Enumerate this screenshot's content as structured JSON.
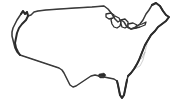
{
  "figure": {
    "projection_note": "Albers-like conic, lower 48 states",
    "background_color": "#ffffff",
    "state_border_color": "#a8a8a8",
    "national_outline_color": "#3a3a3a",
    "coast_emphasis_color": "#2b2b2b",
    "lake_outline_color": "#2e2e2e",
    "width_px": "174",
    "height_px": "108",
    "labels_shown": "none",
    "legend_shown": "none"
  },
  "regions": {
    "pacific_coast_label": "Pacific coastline",
    "atlantic_coast_label": "Atlantic coastline",
    "gulf_coast_label": "Gulf of Mexico coastline",
    "northern_border_label": "Canada border",
    "southern_border_label": "Mexico border",
    "great_lakes_label": "Great Lakes",
    "florida_label": "Florida peninsula",
    "texas_label": "Texas",
    "new_england_label": "New England",
    "chesapeake_label": "Chesapeake Bay",
    "mississippi_delta_label": "Mississippi Delta",
    "puget_sound_label": "Puget Sound"
  },
  "map_paths": {
    "outer_boundary": "M 21 14 L 23 11 L 25 14 L 27 12 L 28 16 L 31 15 L 34 12 L 38 11 L 46 10 L 60 9 L 75 8 L 92 7 L 104 6 L 108 9 L 112 14 L 115 19 L 118 22 L 121 20 L 124 22 L 127 27 L 131 29 L 136 27 L 140 24 L 143 20 L 146 14 L 149 10 L 152 5 L 156 3 L 160 6 L 163 11 L 166 15 L 169 17 L 166 21 L 162 24 L 158 27 L 155 31 L 151 35 L 148 40 L 145 45 L 143 50 L 141 55 L 139 60 L 137 64 L 134 69 L 131 73 L 128 76 L 127 80 L 126 85 L 125 90 L 124 95 L 122 98 L 120 95 L 119 90 L 118 85 L 117 81 L 114 79 L 109 78 L 104 77 L 99 76 L 95 75 L 91 76 L 88 78 L 85 80 L 82 82 L 79 84 L 76 86 L 73 87 L 70 85 L 68 81 L 66 77 L 64 73 L 62 70 L 59 68 L 56 67 L 53 66 L 50 65 L 47 64 L 44 63 L 41 62 L 38 61 L 35 60 L 32 59 L 29 58 L 26 57 L 23 56 L 20 55 L 17 52 L 15 48 L 14 44 L 13 40 L 12 36 L 12 32 L 13 28 L 15 24 L 17 20 L 19 17 Z",
    "state_lines": [
      "M 21 14 L 23 11 L 25 14 L 27 12 L 28 16 L 31 15 L 34 12 L 38 11 L 40 25 L 36 26 L 32 27 L 28 28 L 24 29 L 21 30 L 19 26 L 18 22 L 19 17 Z",
      "M 19 30 L 24 29 L 28 28 L 32 27 L 36 26 L 40 25 L 41 36 L 36 37 L 31 38 L 27 39 L 23 40 L 18 41 L 17 36 L 18 33 Z",
      "M 18 41 L 23 40 L 27 39 L 31 38 L 36 37 L 41 36 L 42 44 L 38 45 L 34 46 L 30 47 L 26 48 L 22 49 L 20 46 Z",
      "M 38 11 L 46 10 L 47 20 L 48 28 L 44 29 L 40 25 Z",
      "M 40 25 L 44 29 L 48 28 L 49 38 L 45 39 L 41 36 Z",
      "M 41 36 L 45 39 L 49 38 L 50 48 L 46 49 L 42 44 Z",
      "M 42 44 L 46 49 L 50 48 L 51 58 L 47 60 L 43 56 Z",
      "M 46 10 L 60 9 L 61 20 L 62 28 L 55 29 L 47 20 Z",
      "M 47 20 L 55 29 L 62 28 L 63 38 L 56 39 L 49 38 L 48 28 Z",
      "M 49 38 L 56 39 L 63 38 L 64 48 L 57 49 L 50 48 Z",
      "M 50 48 L 57 49 L 64 48 L 65 58 L 58 60 L 51 58 Z",
      "M 60 9 L 75 8 L 76 20 L 77 28 L 69 29 L 61 20 Z",
      "M 61 20 L 69 29 L 77 28 L 78 38 L 70 39 L 62 28 Z",
      "M 62 28 L 70 39 L 78 38 L 79 48 L 71 49 L 63 38 Z",
      "M 63 38 L 71 49 L 79 48 L 80 58 L 72 60 L 64 48 Z",
      "M 75 8 L 92 7 L 93 18 L 94 26 L 84 27 L 76 20 Z",
      "M 76 20 L 84 27 L 94 26 L 95 36 L 86 37 L 77 28 Z",
      "M 77 28 L 86 37 L 95 36 L 96 46 L 87 47 L 78 38 Z",
      "M 78 38 L 87 47 L 96 46 L 97 56 L 88 58 L 79 48 Z",
      "M 92 7 L 104 6 L 105 17 L 106 25 L 98 26 L 93 18 Z",
      "M 93 18 L 98 26 L 106 25 L 107 34 L 99 35 L 94 26 Z",
      "M 94 26 L 99 35 L 107 34 L 108 43 L 100 44 L 95 36 Z",
      "M 95 36 L 100 44 L 108 43 L 109 52 L 101 54 L 96 46 Z",
      "M 104 6 L 108 9 L 112 14 L 115 19 L 112 25 L 108 26 L 105 17 Z",
      "M 105 17 L 108 26 L 112 25 L 115 19 L 118 22 L 121 20 L 122 28 L 116 31 L 110 33 L 107 34 L 106 25 Z",
      "M 107 34 L 110 33 L 116 31 L 122 28 L 123 36 L 117 38 L 111 40 L 108 43 Z",
      "M 108 43 L 111 40 L 117 38 L 123 36 L 124 45 L 118 47 L 112 49 L 109 52 Z",
      "M 121 20 L 124 22 L 127 27 L 131 29 L 132 36 L 127 37 L 122 28 Z",
      "M 122 28 L 127 37 L 132 36 L 133 44 L 128 45 L 123 36 Z",
      "M 123 36 L 128 45 L 133 44 L 134 53 L 129 54 L 124 45 Z",
      "M 131 29 L 136 27 L 140 24 L 143 20 L 144 28 L 138 31 L 132 36 Z",
      "M 132 36 L 138 31 L 144 28 L 146 36 L 139 39 L 133 44 Z",
      "M 133 44 L 139 39 L 146 36 L 147 44 L 141 48 L 134 53 Z",
      "M 143 20 L 146 14 L 149 10 L 152 5 L 156 3 L 158 10 L 152 14 L 147 18 L 144 28 Z",
      "M 156 3 L 160 6 L 163 11 L 166 15 L 169 17 L 164 20 L 159 22 L 158 10 Z",
      "M 134 53 L 141 48 L 147 44 L 145 52 L 142 58 L 136 62 Z",
      "M 136 62 L 142 58 L 145 52 L 143 60 L 140 66 L 134 69 Z",
      "M 109 52 L 112 49 L 118 47 L 124 45 L 125 54 L 119 57 L 113 59 L 110 61 Z",
      "M 110 61 L 113 59 L 119 57 L 125 54 L 126 63 L 120 66 L 114 68 L 111 70 Z",
      "M 97 56 L 101 54 L 109 52 L 110 61 L 104 63 L 98 65 Z",
      "M 98 65 L 104 63 L 110 61 L 111 70 L 105 72 L 99 74 Z",
      "M 80 58 L 88 58 L 97 56 L 98 65 L 90 67 L 82 68 Z",
      "M 82 68 L 90 67 L 98 65 L 99 74 L 95 75 L 91 76 L 88 78 L 85 80 Z",
      "M 51 58 L 58 60 L 65 58 L 67 66 L 64 73 L 62 70 L 59 68 L 56 67 L 53 66 Z",
      "M 65 58 L 72 60 L 80 58 L 82 68 L 85 80 L 82 82 L 79 84 L 76 86 L 73 87 L 70 85 L 68 81 L 66 77 L 64 73 L 67 66 Z",
      "M 111 70 L 114 68 L 120 66 L 126 63 L 127 72 L 121 75 L 115 77 L 114 79 Z",
      "M 114 79 L 117 81 L 118 85 L 119 90 L 120 95 L 122 98 L 124 95 L 125 90 L 126 85 L 127 80 L 128 76 L 127 72 L 121 75 L 115 77 Z"
    ],
    "great_lakes": [
      "M 112 17 L 115 16 L 119 18 L 121 22 L 120 26 L 117 28 L 114 27 L 112 24 L 111 20 Z",
      "M 121 20 L 125 19 L 128 22 L 128 26 L 125 28 L 122 27 L 121 24 Z",
      "M 106 14 L 111 13 L 114 15 L 113 18 L 109 19 L 106 17 Z",
      "M 128 24 L 133 23 L 137 25 L 136 28 L 131 29 L 128 27 Z",
      "M 136 26 L 142 24 L 146 22 L 145 25 L 140 27 L 136 28 Z"
    ],
    "heavy_coasts": [
      "M 21 14 L 23 11 L 25 14 L 27 12 L 28 16 L 26 20 L 22 24 L 19 28 L 17 33 L 16 38 L 15 43 L 16 48 L 18 52 L 20 55",
      "M 152 5 L 156 3 L 160 6 L 163 11 L 166 15 L 169 17 L 166 21 L 162 24 L 158 27 L 155 31 L 151 35 L 148 40 L 145 45 L 143 50 L 141 55 L 139 60 L 137 64 L 134 69 L 131 73 L 128 76",
      "M 127 80 L 126 85 L 125 90 L 124 95 L 122 98 L 120 95 L 119 90 L 118 85 L 117 81"
    ],
    "delta": "M 99 74 L 104 73 L 106 75 L 104 78 L 100 78 L 98 76 Z"
  }
}
